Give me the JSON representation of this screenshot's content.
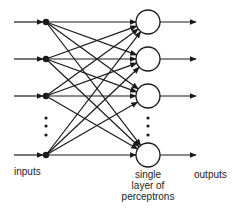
{
  "diagram": {
    "type": "single-layer perceptron network",
    "colors": {
      "line": "#1a1a1a",
      "background": "#ffffff",
      "node_fill": "#ffffff"
    },
    "input_nodes_y": [
      22,
      59,
      96,
      155
    ],
    "perceptron_nodes_y": [
      22,
      59,
      96,
      155
    ],
    "input_x": 46,
    "perceptron_x": 148,
    "perceptron_radius": 12,
    "ellipsis_dots": true,
    "labels": {
      "inputs": "inputs",
      "layer_line1": "single",
      "layer_line2": "layer of",
      "layer_line3": "perceptrons",
      "outputs": "outputs"
    }
  }
}
